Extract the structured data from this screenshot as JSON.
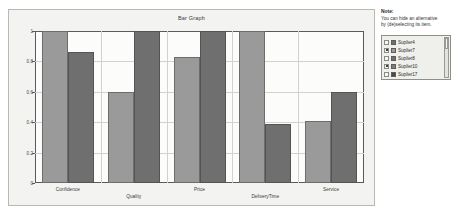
{
  "note": {
    "title": "Note:",
    "line1": "You can hide an alternative",
    "line2": "by (de)selecting its item."
  },
  "legend": {
    "items": [
      {
        "label": "Suplier4",
        "checked": false,
        "color": "#6f6f6f"
      },
      {
        "label": "Suplier7",
        "checked": true,
        "color": "#9a9a9a"
      },
      {
        "label": "Suplier8",
        "checked": false,
        "color": "#6f6f6f"
      },
      {
        "label": "Suplier10",
        "checked": true,
        "color": "#7d7d7d"
      },
      {
        "label": "Suplier17",
        "checked": false,
        "color": "#4a4a4a"
      }
    ]
  },
  "chart_data": {
    "type": "bar",
    "title": "Bar Graph",
    "xlabel": "",
    "ylabel": "",
    "ylim": [
      0,
      1
    ],
    "yticks": [
      "0",
      "0.2",
      "0.4",
      "0.6",
      "0.8",
      "1"
    ],
    "grid": true,
    "legend_position": "right",
    "categories": [
      "Confidence",
      "Quality",
      "Price",
      "DeliveryTime",
      "Service"
    ],
    "series": [
      {
        "name": "Suplier7",
        "color": "#9a9a9a",
        "values": [
          1.0,
          0.6,
          0.83,
          1.0,
          0.41
        ]
      },
      {
        "name": "Suplier10",
        "color": "#6f6f6f",
        "values": [
          0.86,
          1.0,
          1.0,
          0.39,
          0.6
        ]
      }
    ]
  }
}
